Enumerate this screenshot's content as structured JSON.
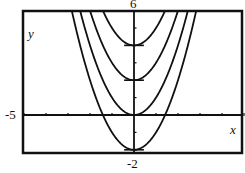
{
  "chart_data": {
    "type": "line",
    "title": "",
    "xlabel": "x",
    "ylabel": "y",
    "xlim": [
      -5,
      5
    ],
    "ylim": [
      -2,
      6
    ],
    "grid": false,
    "legend": null,
    "window_labels": {
      "xmin": "-5",
      "ymax": "6",
      "ymin": "-2"
    },
    "x_ticks_step": 1,
    "y_ticks_step": 1,
    "series": [
      {
        "name": "y = x^2 - 2",
        "c": -2,
        "vertex": [
          0,
          -2
        ]
      },
      {
        "name": "y = x^2",
        "c": 0,
        "vertex": [
          0,
          0
        ]
      },
      {
        "name": "y = x^2 + 2",
        "c": 2,
        "vertex": [
          0,
          2
        ]
      },
      {
        "name": "y = x^2 + 4",
        "c": 4,
        "vertex": [
          0,
          4
        ]
      }
    ],
    "line_color": "#111111",
    "frame_color": "#111111"
  },
  "labels": {
    "ymax": "6",
    "xmin": "-5",
    "ymin": "-2",
    "xaxis": "x",
    "yaxis": "y"
  }
}
